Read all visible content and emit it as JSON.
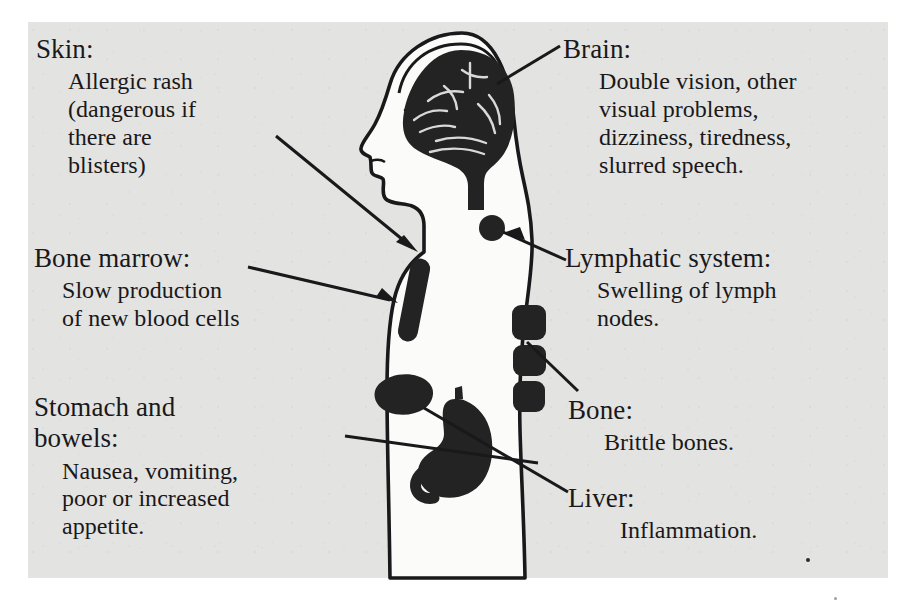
{
  "diagram": {
    "colors": {
      "page_background": "#e3e3e1",
      "outer_background": "#ffffff",
      "ink": "#19181a",
      "organ_fill": "#232323",
      "body_fill": "#fbfbfa"
    }
  },
  "labels": [
    {
      "id": "skin",
      "heading": "Skin:",
      "body": "Allergic rash\n(dangerous if\nthere are\nblisters)",
      "side": "left"
    },
    {
      "id": "bone-marrow",
      "heading": "Bone marrow:",
      "body": "Slow production\nof new blood cells",
      "side": "left"
    },
    {
      "id": "stomach-bowels",
      "heading": "Stomach and\nbowels:",
      "body": "Nausea, vomiting,\npoor or increased\nappetite.",
      "side": "left"
    },
    {
      "id": "brain",
      "heading": "Brain:",
      "body": "Double vision, other\nvisual problems,\ndizziness, tiredness,\nslurred speech.",
      "side": "right"
    },
    {
      "id": "lymphatic-system",
      "heading": "Lymphatic system:",
      "body": "Swelling of lymph\nnodes.",
      "side": "right"
    },
    {
      "id": "bone",
      "heading": "Bone:",
      "body": "Brittle bones.",
      "side": "right"
    },
    {
      "id": "liver",
      "heading": "Liver:",
      "body": "Inflammation.",
      "side": "right"
    }
  ],
  "anatomy": [
    {
      "id": "brain",
      "name": "brain",
      "shape": "cerebrum-with-brainstem"
    },
    {
      "id": "head",
      "name": "head-profile",
      "shape": "facing-left"
    },
    {
      "id": "lymph-node",
      "name": "lymph-node",
      "shape": "circle"
    },
    {
      "id": "sternum",
      "name": "sternum-bone-marrow",
      "shape": "elongated-capsule"
    },
    {
      "id": "vertebrae",
      "name": "vertebrae",
      "shape": "three-rounded-blocks"
    },
    {
      "id": "liver",
      "name": "liver",
      "shape": "wedge"
    },
    {
      "id": "stomach",
      "name": "stomach",
      "shape": "j-shaped-with-duodenum"
    }
  ],
  "leader_lines": [
    {
      "id": "skin-leader",
      "from": "skin",
      "to": "torso-skin-surface",
      "arrowhead": true
    },
    {
      "id": "marrow-leader",
      "from": "bone-marrow",
      "to": "sternum",
      "arrowhead": true
    },
    {
      "id": "stomach-leader",
      "from": "stomach-bowels",
      "to": "stomach",
      "arrowhead": false
    },
    {
      "id": "brain-leader",
      "from": "brain",
      "to": "brain",
      "arrowhead": false
    },
    {
      "id": "lymph-leader",
      "from": "lymphatic-system",
      "to": "lymph-node",
      "arrowhead": true
    },
    {
      "id": "bone-leader",
      "from": "bone",
      "to": "vertebrae",
      "arrowhead": false
    },
    {
      "id": "liver-leader",
      "from": "liver",
      "to": "liver",
      "arrowhead": false
    }
  ]
}
